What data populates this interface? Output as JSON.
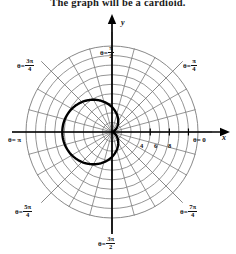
{
  "caption": "The graph will be a cardioid.",
  "figure": {
    "type": "polar-plot",
    "axis_labels": {
      "x": "x",
      "y": "y"
    },
    "radial_ticks": [
      {
        "label": "4",
        "r": 4
      },
      {
        "label": "6",
        "r": 6
      },
      {
        "label": "8",
        "r": 8
      }
    ],
    "theta_labels": [
      {
        "id": "theta-pi-over-2",
        "symbol": "θ",
        "eq": "=",
        "num": "π",
        "den": "2",
        "angle_deg": 90,
        "text": "θ = π/2"
      },
      {
        "id": "theta-pi-over-4",
        "symbol": "θ",
        "eq": "=",
        "num": "π",
        "den": "4",
        "angle_deg": 45,
        "text": "θ = π/4"
      },
      {
        "id": "theta-3pi-over-4",
        "symbol": "θ",
        "eq": "=",
        "num": "3π",
        "den": "4",
        "angle_deg": 135,
        "text": "θ = 3π/4"
      },
      {
        "id": "theta-pi",
        "symbol": "θ",
        "eq": "=",
        "num": "π",
        "den": "",
        "angle_deg": 180,
        "text": "θ = π"
      },
      {
        "id": "theta-5pi-over-4",
        "symbol": "θ",
        "eq": "=",
        "num": "5π",
        "den": "4",
        "angle_deg": 225,
        "text": "θ = 5π/4"
      },
      {
        "id": "theta-3pi-over-2",
        "symbol": "θ",
        "eq": "=",
        "num": "3π",
        "den": "2",
        "angle_deg": 270,
        "text": "θ = 3π/2"
      },
      {
        "id": "theta-7pi-over-4",
        "symbol": "θ",
        "eq": "=",
        "num": "7π",
        "den": "4",
        "angle_deg": 315,
        "text": "θ = 7π/4"
      },
      {
        "id": "theta-0",
        "symbol": "θ",
        "eq": "=",
        "num": "0",
        "den": "",
        "angle_deg": 0,
        "text": "θ = 0"
      }
    ],
    "grid": {
      "circles": 9,
      "max_radius": 9,
      "spoke_count": 24,
      "spoke_step_deg": 15,
      "grid_color": "#7a7a7a",
      "axis_color": "#000000"
    },
    "curve": {
      "name": "cardioid",
      "equation_form": "r = a(1 - cosθ)",
      "amplitude": 2.6,
      "orientation": "opens-left",
      "cusp_at": "origin",
      "color": "#000000",
      "stroke_width": 2.4
    }
  }
}
